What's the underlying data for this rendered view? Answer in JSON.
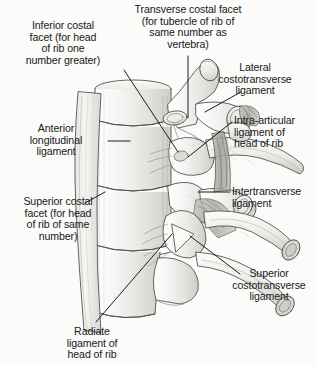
{
  "figure": {
    "background_color": "#fbfbf9",
    "ink_color": "#18181a",
    "style": "graphite pencil anatomical illustration"
  },
  "labels": {
    "inferior_costal_facet": "Inferior costal\nfacet (for head\nof rib one\nnumber greater)",
    "transverse_costal_facet": "Transverse costal facet\n(for tubercle of rib of\nsame number as\nvertebra)",
    "lateral_costotransverse_ligament": "Lateral\ncostotransverse\nligament",
    "anterior_longitudinal_ligament": "Anterior\nlongitudinal\nligament",
    "intra_articular_ligament": "Intra-articular\nligament of\nhead of rib",
    "superior_costal_facet": "Superior costal\nfacet (for head\nof rib of same\nnumber)",
    "intertransverse_ligament": "Intertransverse\nligament",
    "superior_costotransverse_ligament": "Superior\ncostotransverse\nligament",
    "radiate_ligament": "Radiate\nligament of\nhead of rib"
  }
}
